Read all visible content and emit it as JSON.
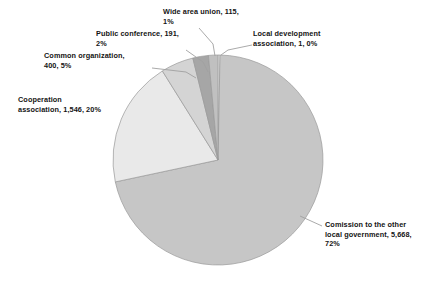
{
  "chart_data": {
    "type": "pie",
    "title": "",
    "subtitle": "",
    "xlabel": "",
    "ylabel": "",
    "legend_position": "none",
    "grid": false,
    "total": 7921,
    "start_angle_deg": 0,
    "direction": "clockwise",
    "categories": [
      "Local development association",
      "Comission to the other local government",
      "Cooperation association",
      "Common organization",
      "Public conference",
      "Wide area union"
    ],
    "values": [
      1,
      5668,
      1546,
      400,
      191,
      115
    ],
    "percents": [
      0,
      72,
      20,
      5,
      2,
      1
    ],
    "colors": [
      "#ffffff",
      "#c6c6c6",
      "#e9e9e9",
      "#d4d4d4",
      "#a6a6a6",
      "#c0c0c0"
    ],
    "slices": [
      {
        "name": "local-development-association",
        "label": "Local development association",
        "value": 1,
        "value_text": "1",
        "percent": 0,
        "percent_text": "0%",
        "color": "#ffffff"
      },
      {
        "name": "comission-to-the-other-local-government",
        "label": "Comission to the other local government",
        "value": 5668,
        "value_text": "5,668",
        "percent": 72,
        "percent_text": "72%",
        "color": "#c6c6c6"
      },
      {
        "name": "cooperation-association",
        "label": "Cooperation association",
        "value": 1546,
        "value_text": "1,546",
        "percent": 20,
        "percent_text": "20%",
        "color": "#e9e9e9"
      },
      {
        "name": "common-organization",
        "label": "Common organization",
        "value": 400,
        "value_text": "400",
        "percent": 5,
        "percent_text": "5%",
        "color": "#d4d4d4"
      },
      {
        "name": "public-conference",
        "label": "Public conference",
        "value": 191,
        "value_text": "191",
        "percent": 2,
        "percent_text": "2%",
        "color": "#a6a6a6"
      },
      {
        "name": "wide-area-union",
        "label": "Wide area union",
        "value": 115,
        "value_text": "115",
        "percent": 1,
        "percent_text": "1%",
        "color": "#c0c0c0"
      }
    ]
  },
  "labels": {
    "wide_area_union": "Wide area union, 115,\n1%",
    "public_conference": "Public conference, 191,\n2%",
    "common_organization": "Common organization,\n400, 5%",
    "cooperation_association": "Cooperation\nassociation, 1,546, 20%",
    "local_development_association": "Local development\nassociation, 1, 0%",
    "comission_other_local_government": "Comission to the other\nlocal government, 5,668,\n72%"
  },
  "style": {
    "background": "#ffffff",
    "text_color": "#141414",
    "slice_outline": "#9a9a9a",
    "leader_line_color": "#9a9a9a"
  }
}
